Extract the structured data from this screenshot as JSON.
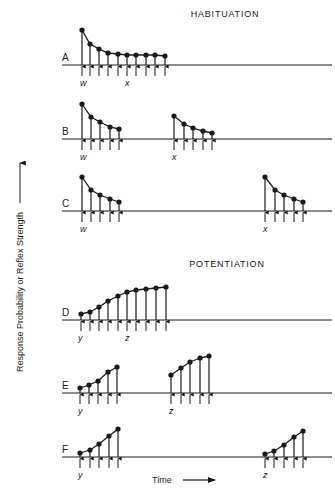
{
  "chart_data": {
    "type": "line",
    "xlabel": "Time",
    "ylabel": "Response Probability or Reflex Strength",
    "sections": [
      {
        "title": "HABITUATION",
        "rows": [
          "A",
          "B",
          "C"
        ]
      },
      {
        "title": "POTENTIATION",
        "rows": [
          "D",
          "E",
          "F"
        ]
      }
    ],
    "rows": [
      {
        "label": "A",
        "baseline_y": 65,
        "stimulus_labels": [
          {
            "text": "w",
            "x": 82
          },
          {
            "text": "x",
            "x": 127
          }
        ],
        "series": [
          {
            "x": [
              82,
              90,
              99,
              108,
              118,
              127,
              136,
              146,
              155,
              165
            ],
            "y": [
              30,
              44,
              49,
              53,
              54,
              55,
              55,
              55,
              55,
              56
            ]
          }
        ]
      },
      {
        "label": "B",
        "baseline_y": 139,
        "stimulus_labels": [
          {
            "text": "w",
            "x": 82
          },
          {
            "text": "x",
            "x": 174
          }
        ],
        "series": [
          {
            "x": [
              82,
              91,
              100,
              110,
              119
            ],
            "y": [
              104,
              117,
              122,
              127,
              129
            ]
          },
          {
            "x": [
              174,
              184,
              193,
              203,
              212
            ],
            "y": [
              116,
              124,
              128,
              131,
              133
            ]
          }
        ]
      },
      {
        "label": "C",
        "baseline_y": 211,
        "stimulus_labels": [
          {
            "text": "w",
            "x": 82
          },
          {
            "text": "x",
            "x": 265
          }
        ],
        "series": [
          {
            "x": [
              82,
              91,
              100,
              110,
              119
            ],
            "y": [
              177,
              190,
              195,
              199,
              202
            ]
          },
          {
            "x": [
              265,
              275,
              284,
              294,
              303
            ],
            "y": [
              177,
              190,
              195,
              199,
              202
            ]
          }
        ]
      },
      {
        "label": "D",
        "baseline_y": 320,
        "stimulus_labels": [
          {
            "text": "y",
            "x": 80
          },
          {
            "text": "z",
            "x": 127
          }
        ],
        "series": [
          {
            "x": [
              81,
              90,
              99,
              108,
              118,
              127,
              136,
              146,
              156,
              166
            ],
            "y": [
              314,
              312,
              307,
              301,
              296,
              292,
              290,
              289,
              288,
              287
            ]
          }
        ]
      },
      {
        "label": "E",
        "baseline_y": 393,
        "stimulus_labels": [
          {
            "text": "y",
            "x": 80
          },
          {
            "text": "z",
            "x": 171
          }
        ],
        "series": [
          {
            "x": [
              80,
              89,
              98,
              108,
              117
            ],
            "y": [
              388,
              385,
              381,
              372,
              367
            ]
          },
          {
            "x": [
              171,
              181,
              190,
              200,
              209
            ],
            "y": [
              375,
              368,
              362,
              358,
              356
            ]
          }
        ]
      },
      {
        "label": "F",
        "baseline_y": 457,
        "stimulus_labels": [
          {
            "text": "y",
            "x": 80
          },
          {
            "text": "z",
            "x": 265
          }
        ],
        "series": [
          {
            "x": [
              80,
              90,
              99,
              109,
              118
            ],
            "y": [
              453,
              450,
              444,
              436,
              429
            ]
          },
          {
            "x": [
              265,
              274,
              284,
              294,
              303
            ],
            "y": [
              454,
              451,
              445,
              437,
              431
            ]
          }
        ]
      }
    ],
    "layout": {
      "axis_line_x_start": 62,
      "axis_line_x_end": 332,
      "arrow_len": 11,
      "grid": false,
      "legend": "none"
    }
  },
  "labels": {
    "habituation_title": "HABITUATION",
    "potentiation_title": "POTENTIATION",
    "y_axis": "Response Probability or Reflex Strength",
    "x_axis": "Time"
  },
  "colors": {
    "ink": "#1a1a1a",
    "background": "#ffffff"
  }
}
